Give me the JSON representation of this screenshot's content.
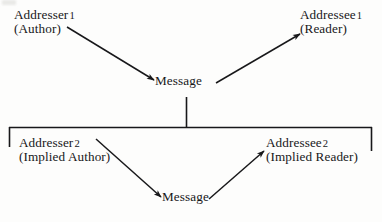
{
  "diagram": {
    "background_color": "#fdfdfc",
    "ink_color": "#18181a",
    "nodes": {
      "addresser_1": {
        "line1": "Addresser",
        "number": "1",
        "line2": "(Author)"
      },
      "addressee_1": {
        "line1": "Addressee",
        "number": "1",
        "line2": "(Reader)"
      },
      "message_1": {
        "line1": "Message",
        "number": "",
        "line2": ""
      },
      "addresser_2": {
        "line1": "Addresser",
        "number": "2",
        "line2": "(Implied Author)"
      },
      "addressee_2": {
        "line1": "Addressee",
        "number": "2",
        "line2": "(Implied Reader)"
      },
      "message_2": {
        "line1": "Message",
        "number": "",
        "line2": ""
      }
    },
    "edges": [
      {
        "name": "addresser-1-to-message-1",
        "from": "addresser_1",
        "to": "message_1",
        "arrowhead": "to"
      },
      {
        "name": "message-1-to-addressee-1",
        "from": "message_1",
        "to": "addressee_1",
        "arrowhead": "to"
      },
      {
        "name": "addresser-2-to-message-2",
        "from": "addresser_2",
        "to": "message_2",
        "arrowhead": "to"
      },
      {
        "name": "message-2-to-addressee-2",
        "from": "message_2",
        "to": "addressee_2",
        "arrowhead": "to"
      }
    ],
    "connectors": [
      {
        "name": "message-1-stem",
        "type": "vertical-line"
      },
      {
        "name": "embedded-level-bracket",
        "type": "bracket"
      }
    ]
  }
}
